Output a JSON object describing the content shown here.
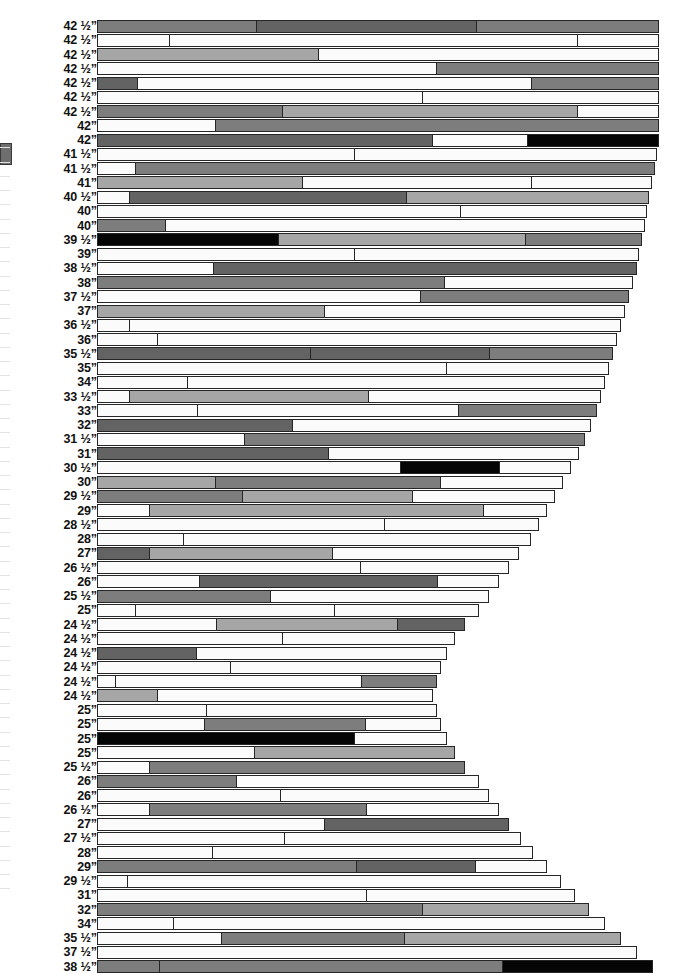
{
  "chart_data": {
    "type": "bar",
    "orientation": "horizontal",
    "title": "",
    "subtitle": "",
    "xlabel": "",
    "ylabel": "",
    "grid": false,
    "legend": null,
    "stacked": true,
    "axis_unit": "inches",
    "max_length_px": 562,
    "palette": {
      "white": "#fbfbfb",
      "light_gray": "#cdcdcd",
      "mid_gray": "#a6a6a6",
      "dark_gray": "#7d7d7d",
      "darker_gray": "#636363",
      "black": "#050505",
      "outline": "#262626"
    },
    "categories": [
      "42 ½”",
      "42 ½”",
      "42 ½”",
      "42 ½”",
      "42 ½”",
      "42 ½”",
      "42 ½”",
      "42”",
      "42”",
      "41 ½”",
      "41 ½”",
      "41”",
      "40 ½”",
      "40”",
      "40”",
      "39 ½”",
      "39”",
      "38 ½”",
      "38”",
      "37 ½”",
      "37”",
      "36 ½”",
      "36”",
      "35 ½”",
      "35”",
      "34”",
      "33 ½”",
      "33”",
      "32”",
      "31 ½”",
      "31”",
      "30 ½”",
      "30”",
      "29 ½”",
      "29”",
      "28 ½”",
      "28”",
      "27”",
      "26 ½”",
      "26”",
      "25 ½”",
      "25”",
      "24 ½”",
      "24 ½”",
      "24 ½”",
      "24 ½”",
      "24 ½”",
      "24 ½”",
      "25”",
      "25”",
      "25”",
      "25”",
      "25 ½”",
      "26”",
      "26”",
      "26 ½”",
      "27”",
      "27 ½”",
      "28”",
      "29”",
      "29 ½”",
      "31”",
      "32”",
      "34”",
      "35 ½”",
      "37 ½”",
      "38 ½”"
    ],
    "values": [
      562,
      562,
      562,
      562,
      562,
      562,
      562,
      562,
      562,
      560,
      558,
      555,
      552,
      550,
      548,
      545,
      542,
      540,
      536,
      532,
      528,
      524,
      520,
      516,
      512,
      508,
      504,
      500,
      494,
      488,
      482,
      474,
      466,
      458,
      450,
      442,
      434,
      422,
      412,
      402,
      392,
      382,
      368,
      358,
      350,
      344,
      340,
      336,
      340,
      344,
      350,
      358,
      368,
      382,
      392,
      402,
      412,
      424,
      436,
      450,
      464,
      478,
      492,
      508,
      524,
      540,
      556
    ],
    "rows": [
      {
        "label": "42 ½”",
        "segments": [
          {
            "shade": "dark_gray",
            "width": 160
          },
          {
            "shade": "darker_gray",
            "width": 220
          },
          {
            "shade": "dark_gray",
            "width": 182
          }
        ]
      },
      {
        "label": "42 ½”",
        "segments": [
          {
            "shade": "white",
            "width": 72
          },
          {
            "shade": "white",
            "width": 410
          },
          {
            "shade": "white",
            "width": 80
          }
        ]
      },
      {
        "label": "42 ½”",
        "segments": [
          {
            "shade": "mid_gray",
            "width": 222
          },
          {
            "shade": "white",
            "width": 340
          }
        ]
      },
      {
        "label": "42 ½”",
        "segments": [
          {
            "shade": "white",
            "width": 340
          },
          {
            "shade": "dark_gray",
            "width": 222
          }
        ]
      },
      {
        "label": "42 ½”",
        "segments": [
          {
            "shade": "darker_gray",
            "width": 40
          },
          {
            "shade": "white",
            "width": 396
          },
          {
            "shade": "dark_gray",
            "width": 126
          }
        ]
      },
      {
        "label": "42 ½”",
        "segments": [
          {
            "shade": "white",
            "width": 326
          },
          {
            "shade": "white",
            "width": 236
          }
        ]
      },
      {
        "label": "42 ½”",
        "segments": [
          {
            "shade": "dark_gray",
            "width": 186
          },
          {
            "shade": "mid_gray",
            "width": 296
          },
          {
            "shade": "white",
            "width": 80
          }
        ]
      },
      {
        "label": "42”",
        "segments": [
          {
            "shade": "white",
            "width": 118
          },
          {
            "shade": "dark_gray",
            "width": 444
          }
        ]
      },
      {
        "label": "42”",
        "segments": [
          {
            "shade": "darker_gray",
            "width": 336
          },
          {
            "shade": "white",
            "width": 96
          },
          {
            "shade": "black",
            "width": 130
          }
        ]
      },
      {
        "label": "41 ½”",
        "segments": [
          {
            "shade": "white",
            "width": 258
          },
          {
            "shade": "white",
            "width": 302
          }
        ]
      },
      {
        "label": "41 ½”",
        "segments": [
          {
            "shade": "white",
            "width": 38
          },
          {
            "shade": "dark_gray",
            "width": 520
          }
        ]
      },
      {
        "label": "41”",
        "segments": [
          {
            "shade": "mid_gray",
            "width": 206
          },
          {
            "shade": "white",
            "width": 230
          },
          {
            "shade": "white",
            "width": 119
          }
        ]
      },
      {
        "label": "40 ½”",
        "segments": [
          {
            "shade": "white",
            "width": 32
          },
          {
            "shade": "darker_gray",
            "width": 278
          },
          {
            "shade": "mid_gray",
            "width": 242
          }
        ]
      },
      {
        "label": "40”",
        "segments": [
          {
            "shade": "white",
            "width": 364
          },
          {
            "shade": "white",
            "width": 186
          }
        ]
      },
      {
        "label": "40”",
        "segments": [
          {
            "shade": "dark_gray",
            "width": 68
          },
          {
            "shade": "white",
            "width": 480
          }
        ]
      },
      {
        "label": "39 ½”",
        "segments": [
          {
            "shade": "black",
            "width": 182
          },
          {
            "shade": "mid_gray",
            "width": 248
          },
          {
            "shade": "dark_gray",
            "width": 115
          }
        ]
      },
      {
        "label": "39”",
        "segments": [
          {
            "shade": "white",
            "width": 258
          },
          {
            "shade": "white",
            "width": 284
          }
        ]
      },
      {
        "label": "38 ½”",
        "segments": [
          {
            "shade": "white",
            "width": 116
          },
          {
            "shade": "darker_gray",
            "width": 424
          }
        ]
      },
      {
        "label": "38”",
        "segments": [
          {
            "shade": "dark_gray",
            "width": 348
          },
          {
            "shade": "white",
            "width": 188
          }
        ]
      },
      {
        "label": "37 ½”",
        "segments": [
          {
            "shade": "white",
            "width": 324
          },
          {
            "shade": "dark_gray",
            "width": 208
          }
        ]
      },
      {
        "label": "37”",
        "segments": [
          {
            "shade": "mid_gray",
            "width": 228
          },
          {
            "shade": "white",
            "width": 300
          }
        ]
      },
      {
        "label": "36 ½”",
        "segments": [
          {
            "shade": "white",
            "width": 32
          },
          {
            "shade": "white",
            "width": 492
          }
        ]
      },
      {
        "label": "36”",
        "segments": [
          {
            "shade": "white",
            "width": 60
          },
          {
            "shade": "white",
            "width": 460
          }
        ]
      },
      {
        "label": "35 ½”",
        "segments": [
          {
            "shade": "darker_gray",
            "width": 214
          },
          {
            "shade": "darker_gray",
            "width": 180
          },
          {
            "shade": "dark_gray",
            "width": 122
          }
        ]
      },
      {
        "label": "35”",
        "segments": [
          {
            "shade": "white",
            "width": 350
          },
          {
            "shade": "white",
            "width": 162
          }
        ]
      },
      {
        "label": "34”",
        "segments": [
          {
            "shade": "white",
            "width": 90
          },
          {
            "shade": "white",
            "width": 418
          }
        ]
      },
      {
        "label": "33 ½”",
        "segments": [
          {
            "shade": "white",
            "width": 32
          },
          {
            "shade": "mid_gray",
            "width": 240
          },
          {
            "shade": "white",
            "width": 232
          }
        ]
      },
      {
        "label": "33”",
        "segments": [
          {
            "shade": "white",
            "width": 100
          },
          {
            "shade": "white",
            "width": 262
          },
          {
            "shade": "dark_gray",
            "width": 138
          }
        ]
      },
      {
        "label": "32”",
        "segments": [
          {
            "shade": "darker_gray",
            "width": 196
          },
          {
            "shade": "white",
            "width": 298
          }
        ]
      },
      {
        "label": "31 ½”",
        "segments": [
          {
            "shade": "white",
            "width": 148
          },
          {
            "shade": "dark_gray",
            "width": 340
          }
        ]
      },
      {
        "label": "31”",
        "segments": [
          {
            "shade": "darker_gray",
            "width": 232
          },
          {
            "shade": "white",
            "width": 250
          }
        ]
      },
      {
        "label": "30 ½”",
        "segments": [
          {
            "shade": "white",
            "width": 304
          },
          {
            "shade": "black",
            "width": 100
          },
          {
            "shade": "white",
            "width": 70
          }
        ]
      },
      {
        "label": "30”",
        "segments": [
          {
            "shade": "mid_gray",
            "width": 118
          },
          {
            "shade": "dark_gray",
            "width": 226
          },
          {
            "shade": "white",
            "width": 122
          }
        ]
      },
      {
        "label": "29 ½”",
        "segments": [
          {
            "shade": "dark_gray",
            "width": 146
          },
          {
            "shade": "mid_gray",
            "width": 170
          },
          {
            "shade": "white",
            "width": 142
          }
        ]
      },
      {
        "label": "29”",
        "segments": [
          {
            "shade": "white",
            "width": 52
          },
          {
            "shade": "mid_gray",
            "width": 336
          },
          {
            "shade": "white",
            "width": 62
          }
        ]
      },
      {
        "label": "28 ½”",
        "segments": [
          {
            "shade": "white",
            "width": 288
          },
          {
            "shade": "white",
            "width": 154
          }
        ]
      },
      {
        "label": "28”",
        "segments": [
          {
            "shade": "white",
            "width": 86
          },
          {
            "shade": "white",
            "width": 348
          }
        ]
      },
      {
        "label": "27”",
        "segments": [
          {
            "shade": "darker_gray",
            "width": 52
          },
          {
            "shade": "mid_gray",
            "width": 184
          },
          {
            "shade": "white",
            "width": 186
          }
        ]
      },
      {
        "label": "26 ½”",
        "segments": [
          {
            "shade": "white",
            "width": 264
          },
          {
            "shade": "white",
            "width": 148
          }
        ]
      },
      {
        "label": "26”",
        "segments": [
          {
            "shade": "white",
            "width": 102
          },
          {
            "shade": "darker_gray",
            "width": 240
          },
          {
            "shade": "white",
            "width": 60
          }
        ]
      },
      {
        "label": "25 ½”",
        "segments": [
          {
            "shade": "dark_gray",
            "width": 174
          },
          {
            "shade": "white",
            "width": 218
          }
        ]
      },
      {
        "label": "25”",
        "segments": [
          {
            "shade": "white",
            "width": 38
          },
          {
            "shade": "white",
            "width": 200
          },
          {
            "shade": "white",
            "width": 144
          }
        ]
      },
      {
        "label": "24 ½”",
        "segments": [
          {
            "shade": "white",
            "width": 120
          },
          {
            "shade": "mid_gray",
            "width": 182
          },
          {
            "shade": "darker_gray",
            "width": 66
          }
        ]
      },
      {
        "label": "24 ½”",
        "segments": [
          {
            "shade": "white",
            "width": 186
          },
          {
            "shade": "white",
            "width": 172
          }
        ]
      },
      {
        "label": "24 ½”",
        "segments": [
          {
            "shade": "darker_gray",
            "width": 100
          },
          {
            "shade": "white",
            "width": 250
          }
        ]
      },
      {
        "label": "24 ½”",
        "segments": [
          {
            "shade": "white",
            "width": 134
          },
          {
            "shade": "white",
            "width": 210
          }
        ]
      },
      {
        "label": "24 ½”",
        "segments": [
          {
            "shade": "white",
            "width": 18
          },
          {
            "shade": "white",
            "width": 248
          },
          {
            "shade": "dark_gray",
            "width": 74
          }
        ]
      },
      {
        "label": "24 ½”",
        "segments": [
          {
            "shade": "mid_gray",
            "width": 60
          },
          {
            "shade": "white",
            "width": 276
          }
        ]
      },
      {
        "label": "25”",
        "segments": [
          {
            "shade": "white",
            "width": 110
          },
          {
            "shade": "white",
            "width": 230
          }
        ]
      },
      {
        "label": "25”",
        "segments": [
          {
            "shade": "white",
            "width": 108
          },
          {
            "shade": "dark_gray",
            "width": 162
          },
          {
            "shade": "white",
            "width": 74
          }
        ]
      },
      {
        "label": "25”",
        "segments": [
          {
            "shade": "black",
            "width": 258
          },
          {
            "shade": "white",
            "width": 92
          }
        ]
      },
      {
        "label": "25”",
        "segments": [
          {
            "shade": "white",
            "width": 158
          },
          {
            "shade": "mid_gray",
            "width": 200
          }
        ]
      },
      {
        "label": "25 ½”",
        "segments": [
          {
            "shade": "white",
            "width": 52
          },
          {
            "shade": "dark_gray",
            "width": 316
          }
        ]
      },
      {
        "label": "26”",
        "segments": [
          {
            "shade": "dark_gray",
            "width": 140
          },
          {
            "shade": "white",
            "width": 242
          }
        ]
      },
      {
        "label": "26”",
        "segments": [
          {
            "shade": "white",
            "width": 184
          },
          {
            "shade": "white",
            "width": 208
          }
        ]
      },
      {
        "label": "26 ½”",
        "segments": [
          {
            "shade": "white",
            "width": 52
          },
          {
            "shade": "dark_gray",
            "width": 218
          },
          {
            "shade": "white",
            "width": 132
          }
        ]
      },
      {
        "label": "27”",
        "segments": [
          {
            "shade": "white",
            "width": 228
          },
          {
            "shade": "darker_gray",
            "width": 184
          }
        ]
      },
      {
        "label": "27 ½”",
        "segments": [
          {
            "shade": "white",
            "width": 188
          },
          {
            "shade": "white",
            "width": 236
          }
        ]
      },
      {
        "label": "28”",
        "segments": [
          {
            "shade": "white",
            "width": 116
          },
          {
            "shade": "white",
            "width": 320
          }
        ]
      },
      {
        "label": "29”",
        "segments": [
          {
            "shade": "dark_gray",
            "width": 260
          },
          {
            "shade": "darker_gray",
            "width": 120
          },
          {
            "shade": "white",
            "width": 70
          }
        ]
      },
      {
        "label": "29 ½”",
        "segments": [
          {
            "shade": "white",
            "width": 30
          },
          {
            "shade": "white",
            "width": 434
          }
        ]
      },
      {
        "label": "31”",
        "segments": [
          {
            "shade": "white",
            "width": 270
          },
          {
            "shade": "white",
            "width": 208
          }
        ]
      },
      {
        "label": "32”",
        "segments": [
          {
            "shade": "dark_gray",
            "width": 326
          },
          {
            "shade": "mid_gray",
            "width": 166
          }
        ]
      },
      {
        "label": "34”",
        "segments": [
          {
            "shade": "white",
            "width": 76
          },
          {
            "shade": "white",
            "width": 432
          }
        ]
      },
      {
        "label": "35 ½”",
        "segments": [
          {
            "shade": "white",
            "width": 124
          },
          {
            "shade": "dark_gray",
            "width": 184
          },
          {
            "shade": "mid_gray",
            "width": 216
          }
        ]
      },
      {
        "label": "37 ½”",
        "segments": [
          {
            "shade": "white",
            "width": 540
          }
        ]
      },
      {
        "label": "38 ½”",
        "segments": [
          {
            "shade": "dark_gray",
            "width": 62
          },
          {
            "shade": "dark_gray",
            "width": 344
          },
          {
            "shade": "black",
            "width": 150
          }
        ]
      }
    ]
  }
}
